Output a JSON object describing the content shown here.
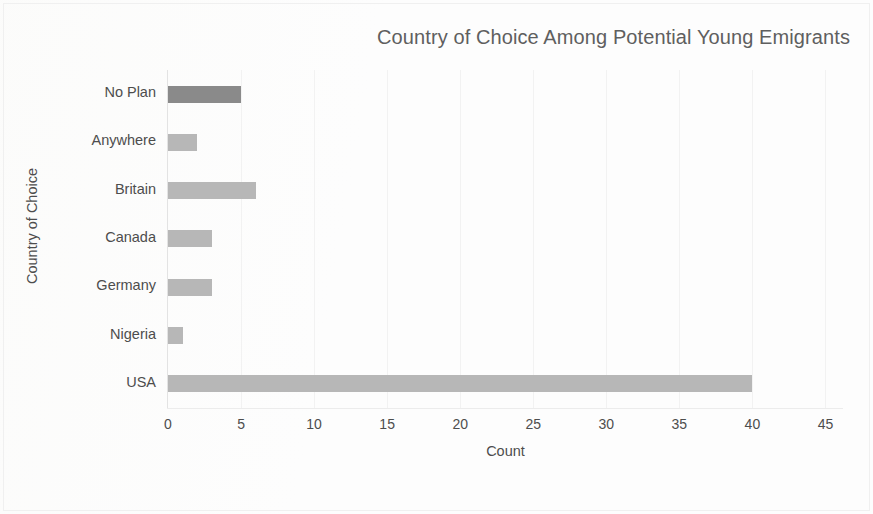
{
  "chart_data": {
    "type": "bar",
    "orientation": "horizontal",
    "title": "Country of Choice Among Potential Young Emigrants",
    "xlabel": "Count",
    "ylabel": "Country of Choice",
    "categories": [
      "No Plan",
      "Anywhere",
      "Britain",
      "Canada",
      "Germany",
      "Nigeria",
      "USA"
    ],
    "values": [
      5,
      2,
      6,
      3,
      3,
      1,
      40
    ],
    "bar_colors": [
      "#8a8a8a",
      "#b7b7b7",
      "#b7b7b7",
      "#b7b7b7",
      "#b7b7b7",
      "#b7b7b7",
      "#b7b7b7"
    ],
    "xlim": [
      0,
      46.2
    ],
    "xticks": [
      0,
      5,
      10,
      15,
      20,
      25,
      30,
      35,
      40,
      45
    ],
    "xtick_labels": [
      "0",
      "5",
      "10",
      "15",
      "20",
      "25",
      "30",
      "35",
      "40",
      "45"
    ],
    "grid": true,
    "grid_axis": "x",
    "grid_color": "#f2f2f2",
    "legend": false,
    "title_color": "#5f5f5f",
    "axis_text_color": "#4d4d4d",
    "background_color": "#fdfdfd"
  }
}
